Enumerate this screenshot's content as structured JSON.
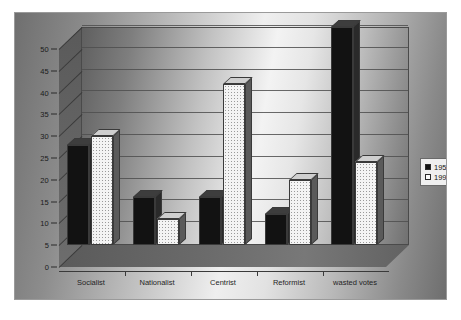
{
  "chart_data": {
    "type": "bar",
    "title": "",
    "subtitle": "",
    "xlabel": "",
    "ylabel": "",
    "categories": [
      "Socialist",
      "Nationalist",
      "Centrist",
      "Reformist",
      "wasted votes"
    ],
    "series": [
      {
        "name": "1955",
        "values": [
          23,
          11,
          11,
          7,
          50
        ],
        "color": "#121212"
      },
      {
        "name": "1999",
        "values": [
          25,
          6,
          37,
          15,
          19
        ],
        "color": "#f4f4f4"
      }
    ],
    "ylim": [
      0,
      50
    ],
    "ytick_step": 5,
    "yticks": [
      0,
      5,
      10,
      15,
      20,
      25,
      30,
      35,
      40,
      45,
      50
    ],
    "grid": true,
    "grid_axis": "y",
    "legend_position": "right",
    "style": "3d-column",
    "background": "gradient-gray"
  },
  "legend": {
    "entries": [
      {
        "label": "1955",
        "swatch": "filled-black"
      },
      {
        "label": "1999",
        "swatch": "dotted-white"
      }
    ]
  }
}
